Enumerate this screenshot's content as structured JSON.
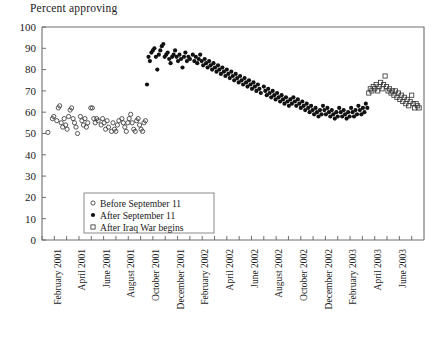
{
  "chart_data": {
    "type": "scatter",
    "title": "Percent approving",
    "xlabel": "",
    "ylabel": "Percent approving",
    "ylim": [
      0,
      100
    ],
    "ytick_values": [
      0,
      10,
      20,
      30,
      40,
      50,
      60,
      70,
      80,
      90,
      100
    ],
    "grid": false,
    "legend_position": "inside-bottom-left",
    "xlim_months": [
      "2001-01",
      "2003-07"
    ],
    "xtick_labels": [
      "February 2001",
      "April 2001",
      "June 2001",
      "August 2001",
      "October 2001",
      "December 2001",
      "February 2002",
      "April 2002",
      "June 2002",
      "August 2002",
      "October 2002",
      "December 2002",
      "February 2003",
      "April 2003",
      "June 2003"
    ],
    "xtick_months": [
      "2001-02",
      "2001-04",
      "2001-06",
      "2001-08",
      "2001-10",
      "2001-12",
      "2002-02",
      "2002-04",
      "2002-06",
      "2002-08",
      "2002-10",
      "2002-12",
      "2003-02",
      "2003-04",
      "2003-06"
    ],
    "series": [
      {
        "name": "Before September 11",
        "marker": "open-circle",
        "color": "#3a3a3a",
        "points": [
          [
            2001.04,
            50.5
          ],
          [
            2001.07,
            57
          ],
          [
            2001.08,
            58
          ],
          [
            2001.1,
            56
          ],
          [
            2001.11,
            62
          ],
          [
            2001.12,
            63
          ],
          [
            2001.13,
            55
          ],
          [
            2001.14,
            53
          ],
          [
            2001.15,
            57
          ],
          [
            2001.16,
            54
          ],
          [
            2001.17,
            52
          ],
          [
            2001.18,
            58
          ],
          [
            2001.19,
            61
          ],
          [
            2001.2,
            62
          ],
          [
            2001.21,
            57
          ],
          [
            2001.22,
            55
          ],
          [
            2001.23,
            53
          ],
          [
            2001.24,
            50
          ],
          [
            2001.26,
            58
          ],
          [
            2001.27,
            56
          ],
          [
            2001.28,
            54
          ],
          [
            2001.29,
            57
          ],
          [
            2001.3,
            53
          ],
          [
            2001.31,
            55
          ],
          [
            2001.33,
            62
          ],
          [
            2001.34,
            62
          ],
          [
            2001.35,
            57
          ],
          [
            2001.36,
            55
          ],
          [
            2001.37,
            57
          ],
          [
            2001.38,
            56
          ],
          [
            2001.4,
            54
          ],
          [
            2001.41,
            57
          ],
          [
            2001.42,
            55
          ],
          [
            2001.43,
            52
          ],
          [
            2001.44,
            56
          ],
          [
            2001.45,
            53
          ],
          [
            2001.47,
            51
          ],
          [
            2001.48,
            55
          ],
          [
            2001.49,
            52
          ],
          [
            2001.5,
            51
          ],
          [
            2001.51,
            54
          ],
          [
            2001.52,
            56
          ],
          [
            2001.54,
            57
          ],
          [
            2001.55,
            55
          ],
          [
            2001.56,
            53
          ],
          [
            2001.57,
            51
          ],
          [
            2001.58,
            55
          ],
          [
            2001.59,
            57
          ],
          [
            2001.6,
            59
          ],
          [
            2001.61,
            55
          ],
          [
            2001.62,
            52
          ],
          [
            2001.63,
            51
          ],
          [
            2001.64,
            56
          ],
          [
            2001.65,
            57
          ],
          [
            2001.66,
            54
          ],
          [
            2001.67,
            52
          ],
          [
            2001.68,
            51
          ],
          [
            2001.69,
            55
          ],
          [
            2001.7,
            56
          ]
        ]
      },
      {
        "name": "After September 11",
        "marker": "filled-circle",
        "color": "#111111",
        "points": [
          [
            2001.71,
            73
          ],
          [
            2001.72,
            86
          ],
          [
            2001.73,
            84
          ],
          [
            2001.74,
            88
          ],
          [
            2001.75,
            89
          ],
          [
            2001.76,
            90
          ],
          [
            2001.77,
            86
          ],
          [
            2001.78,
            80
          ],
          [
            2001.79,
            87
          ],
          [
            2001.8,
            89
          ],
          [
            2001.81,
            91
          ],
          [
            2001.82,
            92
          ],
          [
            2001.83,
            86
          ],
          [
            2001.84,
            87
          ],
          [
            2001.85,
            88
          ],
          [
            2001.86,
            85
          ],
          [
            2001.87,
            83
          ],
          [
            2001.88,
            86
          ],
          [
            2001.89,
            87
          ],
          [
            2001.9,
            89
          ],
          [
            2001.91,
            86
          ],
          [
            2001.92,
            84
          ],
          [
            2001.93,
            87
          ],
          [
            2001.94,
            85
          ],
          [
            2001.95,
            81
          ],
          [
            2001.96,
            86
          ],
          [
            2001.97,
            88
          ],
          [
            2001.98,
            84
          ],
          [
            2001.99,
            86
          ],
          [
            2002.0,
            85
          ],
          [
            2002.02,
            87
          ],
          [
            2002.03,
            84
          ],
          [
            2002.04,
            86
          ],
          [
            2002.05,
            83
          ],
          [
            2002.06,
            85
          ],
          [
            2002.07,
            87
          ],
          [
            2002.08,
            84
          ],
          [
            2002.09,
            82
          ],
          [
            2002.1,
            85
          ],
          [
            2002.11,
            83
          ],
          [
            2002.12,
            81
          ],
          [
            2002.13,
            84
          ],
          [
            2002.14,
            82
          ],
          [
            2002.15,
            80
          ],
          [
            2002.16,
            83
          ],
          [
            2002.17,
            81
          ],
          [
            2002.18,
            79
          ],
          [
            2002.19,
            82
          ],
          [
            2002.2,
            80
          ],
          [
            2002.21,
            78
          ],
          [
            2002.22,
            81
          ],
          [
            2002.23,
            79
          ],
          [
            2002.24,
            77
          ],
          [
            2002.25,
            80
          ],
          [
            2002.26,
            78
          ],
          [
            2002.27,
            76
          ],
          [
            2002.28,
            79
          ],
          [
            2002.29,
            77
          ],
          [
            2002.3,
            75
          ],
          [
            2002.31,
            78
          ],
          [
            2002.32,
            76
          ],
          [
            2002.33,
            74
          ],
          [
            2002.34,
            77
          ],
          [
            2002.35,
            75
          ],
          [
            2002.36,
            73
          ],
          [
            2002.37,
            76
          ],
          [
            2002.38,
            74
          ],
          [
            2002.39,
            72
          ],
          [
            2002.4,
            75
          ],
          [
            2002.41,
            73
          ],
          [
            2002.42,
            71
          ],
          [
            2002.43,
            74
          ],
          [
            2002.44,
            72
          ],
          [
            2002.45,
            70
          ],
          [
            2002.46,
            73
          ],
          [
            2002.47,
            71
          ],
          [
            2002.48,
            69
          ],
          [
            2002.5,
            72
          ],
          [
            2002.51,
            70
          ],
          [
            2002.52,
            68
          ],
          [
            2002.53,
            71
          ],
          [
            2002.54,
            69
          ],
          [
            2002.55,
            67
          ],
          [
            2002.56,
            70
          ],
          [
            2002.57,
            68
          ],
          [
            2002.58,
            66
          ],
          [
            2002.59,
            69
          ],
          [
            2002.6,
            67
          ],
          [
            2002.61,
            65
          ],
          [
            2002.62,
            68
          ],
          [
            2002.63,
            66
          ],
          [
            2002.64,
            64
          ],
          [
            2002.65,
            67
          ],
          [
            2002.66,
            65
          ],
          [
            2002.67,
            63
          ],
          [
            2002.68,
            66
          ],
          [
            2002.69,
            64
          ],
          [
            2002.7,
            67
          ],
          [
            2002.71,
            65
          ],
          [
            2002.72,
            63
          ],
          [
            2002.73,
            66
          ],
          [
            2002.74,
            64
          ],
          [
            2002.75,
            62
          ],
          [
            2002.76,
            65
          ],
          [
            2002.77,
            63
          ],
          [
            2002.78,
            61
          ],
          [
            2002.79,
            64
          ],
          [
            2002.8,
            62
          ],
          [
            2002.81,
            60
          ],
          [
            2002.82,
            63
          ],
          [
            2002.83,
            61
          ],
          [
            2002.84,
            59
          ],
          [
            2002.85,
            62
          ],
          [
            2002.86,
            60
          ],
          [
            2002.87,
            58
          ],
          [
            2002.88,
            61
          ],
          [
            2002.89,
            59
          ],
          [
            2002.9,
            63
          ],
          [
            2002.91,
            61
          ],
          [
            2002.92,
            59
          ],
          [
            2002.93,
            62
          ],
          [
            2002.94,
            60
          ],
          [
            2002.95,
            58
          ],
          [
            2002.96,
            61
          ],
          [
            2002.97,
            59
          ],
          [
            2002.98,
            57
          ],
          [
            2002.99,
            60
          ],
          [
            2003.0,
            58
          ],
          [
            2003.01,
            62
          ],
          [
            2003.02,
            60
          ],
          [
            2003.03,
            58
          ],
          [
            2003.04,
            61
          ],
          [
            2003.05,
            59
          ],
          [
            2003.06,
            57
          ],
          [
            2003.07,
            60
          ],
          [
            2003.08,
            58
          ],
          [
            2003.09,
            62
          ],
          [
            2003.1,
            60
          ],
          [
            2003.11,
            58
          ],
          [
            2003.12,
            61
          ],
          [
            2003.13,
            59
          ],
          [
            2003.14,
            63
          ],
          [
            2003.15,
            61
          ],
          [
            2003.16,
            59
          ],
          [
            2003.17,
            62
          ],
          [
            2003.18,
            60
          ],
          [
            2003.19,
            64
          ],
          [
            2003.2,
            62
          ]
        ]
      },
      {
        "name": "After Iraq War begins",
        "marker": "open-square",
        "color": "#3a3a3a",
        "points": [
          [
            2003.21,
            69
          ],
          [
            2003.22,
            71
          ],
          [
            2003.23,
            70
          ],
          [
            2003.24,
            72
          ],
          [
            2003.25,
            71
          ],
          [
            2003.26,
            73
          ],
          [
            2003.27,
            70
          ],
          [
            2003.28,
            72
          ],
          [
            2003.29,
            74
          ],
          [
            2003.3,
            71
          ],
          [
            2003.31,
            73
          ],
          [
            2003.32,
            77
          ],
          [
            2003.33,
            72
          ],
          [
            2003.34,
            70
          ],
          [
            2003.35,
            71
          ],
          [
            2003.36,
            69
          ],
          [
            2003.37,
            70
          ],
          [
            2003.38,
            68
          ],
          [
            2003.39,
            70
          ],
          [
            2003.4,
            67
          ],
          [
            2003.41,
            69
          ],
          [
            2003.42,
            66
          ],
          [
            2003.43,
            68
          ],
          [
            2003.44,
            65
          ],
          [
            2003.45,
            67
          ],
          [
            2003.46,
            64
          ],
          [
            2003.47,
            66
          ],
          [
            2003.48,
            63
          ],
          [
            2003.49,
            65
          ],
          [
            2003.5,
            68
          ],
          [
            2003.51,
            64
          ],
          [
            2003.52,
            62
          ],
          [
            2003.53,
            64
          ],
          [
            2003.54,
            63
          ],
          [
            2003.55,
            62
          ]
        ]
      }
    ]
  },
  "legend": {
    "entries": [
      {
        "label": "Before September 11",
        "marker": "open-circle"
      },
      {
        "label": "After September 11",
        "marker": "filled-circle"
      },
      {
        "label": "After Iraq War begins",
        "marker": "open-square"
      }
    ]
  }
}
